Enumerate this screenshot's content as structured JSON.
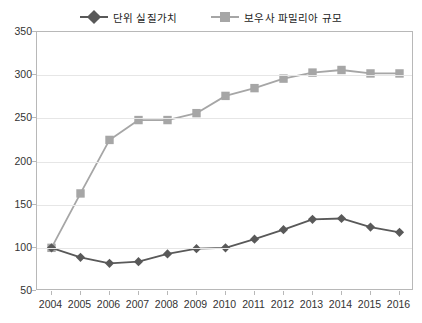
{
  "chart_data": {
    "type": "line",
    "title": "",
    "xlabel": "",
    "ylabel": "",
    "categories": [
      "2004",
      "2005",
      "2006",
      "2007",
      "2008",
      "2009",
      "2010",
      "2011",
      "2012",
      "2013",
      "2014",
      "2015",
      "2016"
    ],
    "ylim": [
      50,
      350
    ],
    "yticks": [
      50,
      100,
      150,
      200,
      250,
      300,
      350
    ],
    "grid": true,
    "legend_position": "top-center",
    "series": [
      {
        "name": "단위 실질가치",
        "marker": "diamond",
        "color": "#595959",
        "values": [
          100,
          89,
          82,
          84,
          93,
          99,
          100,
          110,
          121,
          133,
          134,
          124,
          118
        ]
      },
      {
        "name": "보우사 파밀리아 규모",
        "marker": "square",
        "color": "#a6a6a6",
        "values": [
          100,
          163,
          225,
          248,
          248,
          256,
          276,
          285,
          296,
          303,
          306,
          302,
          302
        ]
      }
    ]
  },
  "legend": {
    "items": [
      {
        "label": "단위 실질가치",
        "marker": "diamond-marker-icon",
        "color": "#595959"
      },
      {
        "label": "보우사 파밀리아 규모",
        "marker": "square-marker-icon",
        "color": "#a6a6a6"
      }
    ]
  },
  "axes": {
    "y_tick_labels": [
      "350",
      "300",
      "250",
      "200",
      "150",
      "100",
      "50"
    ],
    "x_tick_labels": [
      "2004",
      "2005",
      "2006",
      "2007",
      "2008",
      "2009",
      "2010",
      "2011",
      "2012",
      "2013",
      "2014",
      "2015",
      "2016"
    ]
  },
  "colors": {
    "series1": "#595959",
    "series2": "#a6a6a6",
    "grid": "#e6e6e6",
    "frame": "#b8b8b8",
    "text": "#333333"
  }
}
